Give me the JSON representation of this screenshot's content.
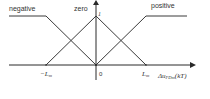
{
  "labels": {
    "negative": "negative",
    "zero": "zero",
    "positive": "positive",
    "peak": "1",
    "neg_lm": "−L",
    "neg_lm_sub": "m",
    "origin": "0",
    "pos_lm": "L",
    "pos_lm_sub": "m",
    "xaxis_main": "Δu",
    "xaxis_sub": "FDm",
    "xaxis_tail": "(kT)"
  },
  "colors": {
    "line": "#3a3a3a",
    "axis": "#2a2a2a",
    "text": "#333333"
  },
  "membership_functions": [
    {
      "name": "negative",
      "shape": "Z",
      "points": [
        [
          "-inf",
          1
        ],
        [
          "-L_m",
          1
        ],
        [
          "0",
          0
        ]
      ]
    },
    {
      "name": "zero",
      "shape": "triangle",
      "points": [
        [
          "-L_m",
          0
        ],
        [
          "0",
          1
        ],
        [
          "L_m",
          0
        ]
      ]
    },
    {
      "name": "positive",
      "shape": "S",
      "points": [
        [
          "0",
          0
        ],
        [
          "L_m",
          1
        ],
        [
          "+inf",
          1
        ]
      ]
    }
  ]
}
